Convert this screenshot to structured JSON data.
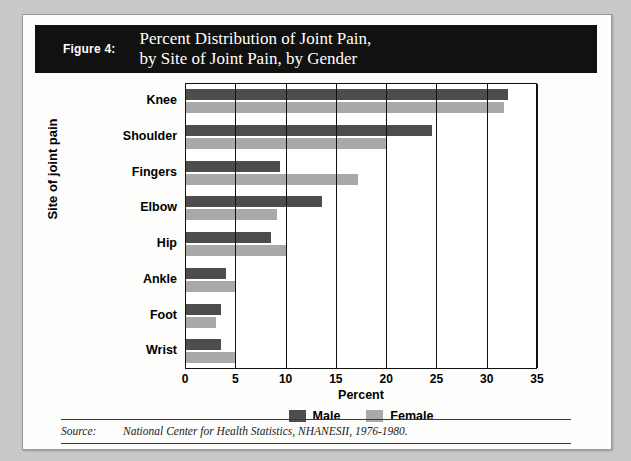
{
  "figure": {
    "number_label": "Figure 4:",
    "title": "Percent Distribution of Joint Pain,\nby Site of Joint Pain, by Gender"
  },
  "source": {
    "label": "Source:",
    "text": "National Center for Health Statistics, NHANESII, 1976-1980."
  },
  "colors": {
    "male": "#4d4d4d",
    "female": "#a9a9a9",
    "banner": "#111110",
    "card": "#fdfdfb",
    "page": "#c9c9c9"
  },
  "chart_data": {
    "type": "bar",
    "orientation": "horizontal",
    "title": "Percent Distribution of Joint Pain, by Site of Joint Pain, by Gender",
    "xlabel": "Percent",
    "ylabel": "Site of joint pain",
    "xlim": [
      0,
      35
    ],
    "xticks": [
      0,
      5,
      10,
      15,
      20,
      25,
      30,
      35
    ],
    "xticklabels": [
      "0",
      "5",
      "10",
      "15",
      "20",
      "25",
      "30",
      "35"
    ],
    "grid": true,
    "legend_position": "bottom",
    "categories": [
      "Knee",
      "Shoulder",
      "Fingers",
      "Elbow",
      "Hip",
      "Ankle",
      "Foot",
      "Wrist"
    ],
    "series": [
      {
        "name": "Male",
        "color": "#4d4d4d",
        "values": [
          32.0,
          24.5,
          9.3,
          13.5,
          8.5,
          4.0,
          3.5,
          3.5
        ]
      },
      {
        "name": "Female",
        "color": "#a9a9a9",
        "values": [
          31.6,
          20.0,
          17.1,
          9.0,
          10.0,
          5.0,
          3.0,
          5.0
        ]
      }
    ]
  }
}
